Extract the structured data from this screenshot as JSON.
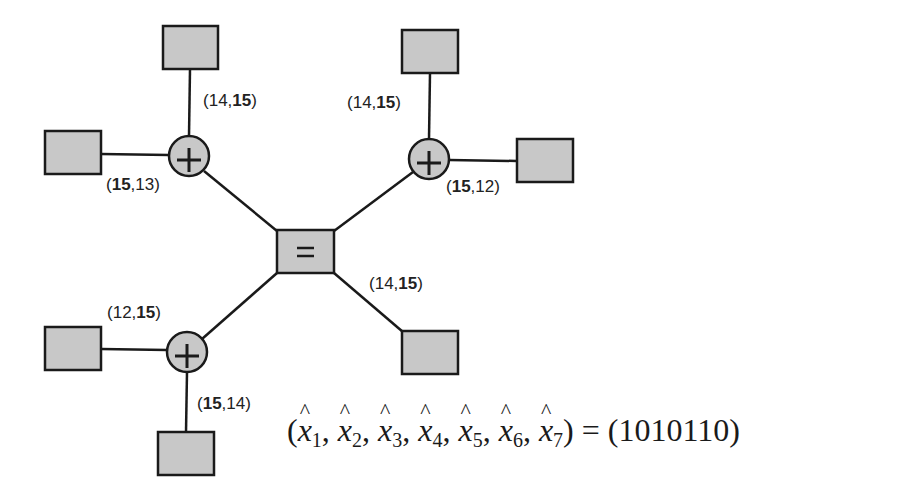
{
  "diagram": {
    "type": "factor-graph",
    "colors": {
      "node_fill": "#c8c8c8",
      "stroke": "#1a1a1a",
      "background": "#ffffff"
    },
    "center_node": {
      "id": "eq",
      "symbol": "=",
      "x": 305,
      "y": 251
    },
    "check_nodes": [
      {
        "id": "c1",
        "symbol": "+",
        "x": 189,
        "y": 156
      },
      {
        "id": "c2",
        "symbol": "+",
        "x": 429,
        "y": 159
      },
      {
        "id": "c3",
        "symbol": "+",
        "x": 187,
        "y": 352
      }
    ],
    "variable_nodes": [
      {
        "id": "v_c1_top",
        "x": 163,
        "y": 26
      },
      {
        "id": "v_c1_left",
        "x": 45,
        "y": 131
      },
      {
        "id": "v_c2_top",
        "x": 402,
        "y": 30
      },
      {
        "id": "v_c2_right",
        "x": 517,
        "y": 139
      },
      {
        "id": "v_eq_br",
        "x": 402,
        "y": 331
      },
      {
        "id": "v_c3_left",
        "x": 45,
        "y": 327
      },
      {
        "id": "v_c3_bottom",
        "x": 158,
        "y": 432
      }
    ],
    "edge_labels": [
      {
        "id": "l1",
        "a": "14",
        "b": "15",
        "bold": "b",
        "x": 203,
        "y": 92
      },
      {
        "id": "l2",
        "a": "15",
        "b": "13",
        "bold": "a",
        "x": 105,
        "y": 176
      },
      {
        "id": "l3",
        "a": "14",
        "b": "15",
        "bold": "b",
        "x": 347,
        "y": 94
      },
      {
        "id": "l4",
        "a": "15",
        "b": "12",
        "bold": "a",
        "x": 446,
        "y": 178
      },
      {
        "id": "l5",
        "a": "14",
        "b": "15",
        "bold": "b",
        "x": 370,
        "y": 275
      },
      {
        "id": "l6",
        "a": "12",
        "b": "15",
        "bold": "b",
        "x": 106,
        "y": 304
      },
      {
        "id": "l7",
        "a": "15",
        "b": "14",
        "bold": "a",
        "x": 197,
        "y": 394
      }
    ]
  },
  "labels": {
    "l1": {
      "open": "(",
      "a": "14",
      "sep": ",",
      "b": "15",
      "close": ")"
    },
    "l2": {
      "open": "(",
      "a": "15",
      "sep": ",",
      "b": "13",
      "close": ")"
    },
    "l3": {
      "open": "(",
      "a": "14",
      "sep": ",",
      "b": "15",
      "close": ")"
    },
    "l4": {
      "open": "(",
      "a": "15",
      "sep": ",",
      "b": "12",
      "close": ")"
    },
    "l5": {
      "open": "(",
      "a": "14",
      "sep": ",",
      "b": "15",
      "close": ")"
    },
    "l6": {
      "open": "(",
      "a": "12",
      "sep": ",",
      "b": "15",
      "close": ")"
    },
    "l7": {
      "open": "(",
      "a": "15",
      "sep": ",",
      "b": "14",
      "close": ")"
    }
  },
  "equation": {
    "lhs_open": "(",
    "vars": [
      "x",
      "x",
      "x",
      "x",
      "x",
      "x",
      "x"
    ],
    "subs": [
      "1",
      "2",
      "3",
      "4",
      "5",
      "6",
      "7"
    ],
    "comma": ",",
    "lhs_close": ")",
    "equals": " = ",
    "rhs": "(1010110)"
  },
  "symbols": {
    "plus": "+",
    "equals": "="
  }
}
